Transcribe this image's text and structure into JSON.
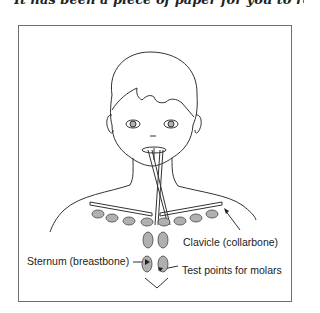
{
  "caption": {
    "text": "It has been a piece of paper for you to remember"
  },
  "figure": {
    "labels": {
      "clavicle": "Clavicle (collarbone)",
      "sternum": "Sternum (breastbone)",
      "test_points": "Test points for molars"
    },
    "colors": {
      "line": "#333333",
      "fill_points": "#b0b0b0",
      "frame": "#6e6e6e"
    }
  }
}
